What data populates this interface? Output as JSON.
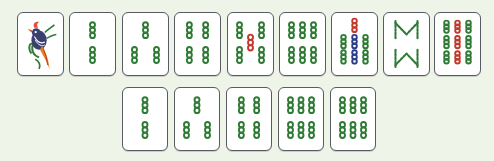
{
  "board": {
    "background": "#eef4e8",
    "suit": "bamboo",
    "colors": {
      "green": "#2f7a35",
      "red": "#c0392b",
      "blue": "#2c3e8a"
    },
    "rows": [
      {
        "tiles": [
          {
            "name": "bamboo-1",
            "rank": 1,
            "glyph": "bird"
          },
          {
            "name": "bamboo-2",
            "rank": 2
          },
          {
            "name": "bamboo-3",
            "rank": 3
          },
          {
            "name": "bamboo-4",
            "rank": 4
          },
          {
            "name": "bamboo-5",
            "rank": 5
          },
          {
            "name": "bamboo-6",
            "rank": 6
          },
          {
            "name": "bamboo-7",
            "rank": 7
          },
          {
            "name": "bamboo-8",
            "rank": 8
          },
          {
            "name": "bamboo-9",
            "rank": 9
          }
        ]
      },
      {
        "tiles": [
          {
            "name": "bamboo-2",
            "rank": 2
          },
          {
            "name": "bamboo-3",
            "rank": 3
          },
          {
            "name": "bamboo-4",
            "rank": 4
          },
          {
            "name": "bamboo-6",
            "rank": 6
          },
          {
            "name": "bamboo-6",
            "rank": 6
          }
        ]
      }
    ]
  }
}
